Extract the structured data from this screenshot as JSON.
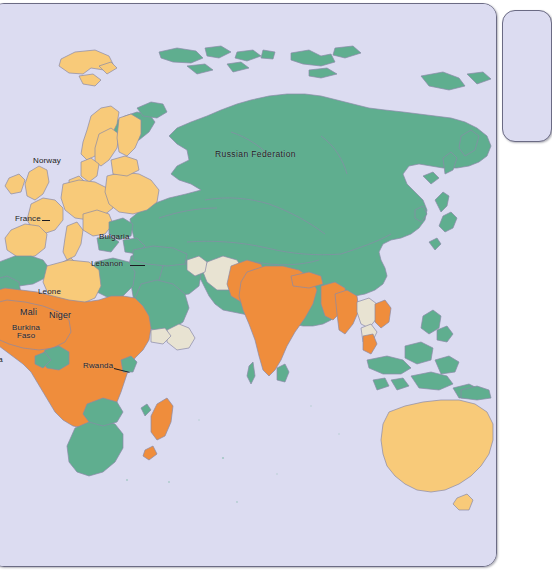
{
  "document": {
    "type": "world-map-figure",
    "panel_title": "",
    "background_color": "#ffffff"
  },
  "map": {
    "name": "world-map",
    "ocean_color": "#dcdcf1",
    "border_color": "#6b6b84",
    "country_border_color": "#8a8aa8",
    "projection_note": "",
    "legend_categories": [
      {
        "key": "green",
        "color": "#5fae8f",
        "label": ""
      },
      {
        "key": "orange",
        "color": "#ef8d3c",
        "label": ""
      },
      {
        "key": "yellow",
        "color": "#f8ca79",
        "label": ""
      },
      {
        "key": "cream",
        "color": "#e8e3d2",
        "label": ""
      }
    ],
    "labels": [
      {
        "id": "russia",
        "text": "Russian  Federation",
        "x": 224,
        "y": 146
      },
      {
        "id": "norway",
        "text": "Norway",
        "x": 42,
        "y": 153
      },
      {
        "id": "france",
        "text": "France",
        "x": 24,
        "y": 211
      },
      {
        "id": "bulgaria",
        "text": "Bulgaria",
        "x": 108,
        "y": 229
      },
      {
        "id": "lebanon",
        "text": "Lebanon",
        "x": 100,
        "y": 256
      },
      {
        "id": "leone",
        "text": "Leone",
        "x": 47,
        "y": 284
      },
      {
        "id": "mali",
        "text": "Mali",
        "x": 29,
        "y": 304
      },
      {
        "id": "niger",
        "text": "Niger",
        "x": 58,
        "y": 307
      },
      {
        "id": "burkina1",
        "text": "Burkina",
        "x": 21,
        "y": 320
      },
      {
        "id": "burkina2",
        "text": "Faso",
        "x": 26,
        "y": 328
      },
      {
        "id": "sierra",
        "text": "erra",
        "x": -3,
        "y": 352
      },
      {
        "id": "rwanda",
        "text": "Rwanda",
        "x": 92,
        "y": 358
      }
    ]
  },
  "side_panel": {
    "name": "adjacent-card",
    "visible_text": ""
  }
}
